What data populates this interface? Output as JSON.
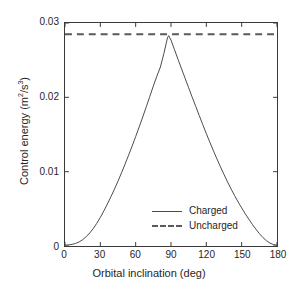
{
  "chart_data": {
    "type": "line",
    "title": "",
    "xlabel": "Orbital inclination (deg)",
    "ylabel": "Control energy (m2/s3)",
    "ylabel_parts": {
      "prefix": "Control energy (m",
      "sup1": "2",
      "mid": "/s",
      "sup2": "3",
      "suffix": ")"
    },
    "xlim": [
      0,
      180
    ],
    "ylim": [
      0,
      0.03
    ],
    "xticks": [
      0,
      30,
      60,
      90,
      120,
      150,
      180
    ],
    "xtick_labels": [
      "0",
      "30",
      "60",
      "90",
      "120",
      "150",
      "180"
    ],
    "yticks": [
      0,
      0.01,
      0.02,
      0.03
    ],
    "ytick_labels": [
      "0",
      "0.01",
      "0.02",
      "0.03"
    ],
    "grid": false,
    "legend_position": "center",
    "series": [
      {
        "name": "Charged",
        "style": "solid",
        "color": "#4a4a4a",
        "x": [
          0,
          3,
          6,
          9,
          12,
          15,
          18,
          21,
          24,
          27,
          30,
          33,
          36,
          39,
          42,
          45,
          48,
          51,
          54,
          57,
          60,
          63,
          66,
          69,
          72,
          75,
          78,
          81,
          84,
          87,
          88,
          90,
          93,
          96,
          99,
          102,
          105,
          108,
          111,
          114,
          117,
          120,
          123,
          126,
          129,
          132,
          135,
          138,
          141,
          144,
          147,
          150,
          153,
          156,
          159,
          162,
          165,
          168,
          171,
          174,
          177,
          180
        ],
        "y": [
          0.00012,
          0.00015,
          0.00022,
          0.00035,
          0.00055,
          0.00085,
          0.00125,
          0.00175,
          0.00235,
          0.00305,
          0.00385,
          0.00472,
          0.00565,
          0.00663,
          0.00765,
          0.00872,
          0.00985,
          0.01102,
          0.01222,
          0.01345,
          0.01472,
          0.01602,
          0.01735,
          0.01872,
          0.02012,
          0.02152,
          0.02285,
          0.02408,
          0.02592,
          0.028,
          0.0283,
          0.0277,
          0.0264,
          0.0251,
          0.02382,
          0.02255,
          0.02128,
          0.02002,
          0.01878,
          0.01755,
          0.01632,
          0.01512,
          0.01395,
          0.01282,
          0.01172,
          0.01065,
          0.00962,
          0.00862,
          0.00768,
          0.00678,
          0.00592,
          0.00512,
          0.00435,
          0.00362,
          0.00292,
          0.00228,
          0.00168,
          0.00115,
          0.00072,
          0.0004,
          0.0002,
          0.00012
        ]
      },
      {
        "name": "Uncharged",
        "style": "dashed",
        "color": "#5a5a5a",
        "constant_value": 0.0285,
        "x": [
          0,
          180
        ],
        "y": [
          0.0285,
          0.0285
        ]
      }
    ],
    "legend": [
      {
        "label": "Charged",
        "style": "solid"
      },
      {
        "label": "Uncharged",
        "style": "dashed"
      }
    ],
    "colors": {
      "axis": "#3a3a3a",
      "text": "#262626",
      "charged": "#4a4a4a",
      "uncharged": "#5a5a5a",
      "background": "#ffffff"
    }
  }
}
